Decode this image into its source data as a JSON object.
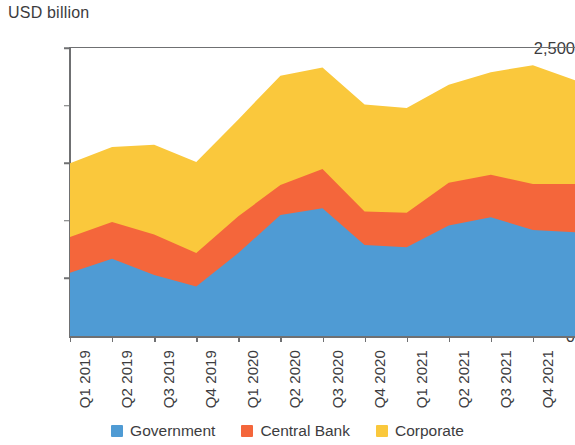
{
  "chart_data": {
    "type": "area",
    "stacked": true,
    "title": "",
    "subtitle": "",
    "unit_label": "USD billion",
    "xlabel": "",
    "ylabel": "USD billion",
    "ylim": [
      0,
      2500
    ],
    "yticks": [
      0,
      500,
      1000,
      1500,
      2000,
      2500
    ],
    "ytick_labels": [
      "0",
      "500",
      "1,000",
      "1,500",
      "2,000",
      "2,500"
    ],
    "grid": false,
    "legend_position": "bottom",
    "categories": [
      "Q1 2019",
      "Q2 2019",
      "Q3 2019",
      "Q4 2019",
      "Q1 2020",
      "Q2 2020",
      "Q3 2020",
      "Q4 2020",
      "Q1 2021",
      "Q2 2021",
      "Q3 2021",
      "Q4 2021",
      "Q1 2022"
    ],
    "series": [
      {
        "name": "Government",
        "color": "#4f9bd4",
        "values": [
          550,
          670,
          530,
          430,
          720,
          1050,
          1110,
          790,
          770,
          960,
          1030,
          920,
          900
        ]
      },
      {
        "name": "Central Bank",
        "color": "#f4663b",
        "values": [
          310,
          320,
          350,
          290,
          320,
          260,
          340,
          290,
          300,
          370,
          370,
          400,
          420
        ]
      },
      {
        "name": "Corporate",
        "color": "#fac83c",
        "values": [
          640,
          650,
          780,
          790,
          840,
          950,
          880,
          930,
          910,
          850,
          890,
          1030,
          900
        ]
      }
    ],
    "totals": [
      1500,
      1640,
      1660,
      1510,
      1880,
      2260,
      2330,
      2010,
      1980,
      2180,
      2290,
      2350,
      2220
    ]
  },
  "legend": {
    "items": [
      {
        "label": "Government",
        "color": "#4f9bd4"
      },
      {
        "label": "Central Bank",
        "color": "#f4663b"
      },
      {
        "label": "Corporate",
        "color": "#fac83c"
      }
    ]
  },
  "axes": {
    "y_unit_title": "USD billion",
    "axis_color": "#6f7072"
  }
}
